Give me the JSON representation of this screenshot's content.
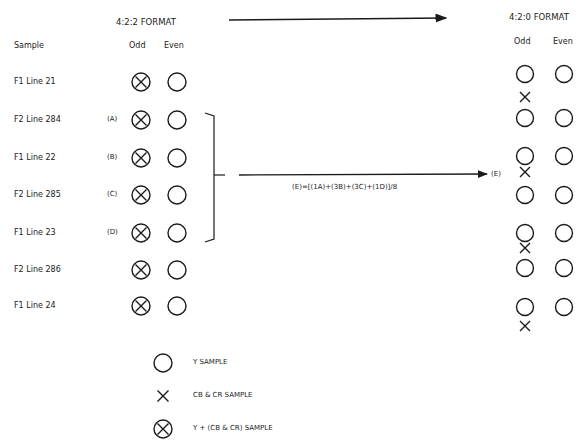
{
  "left_format": {
    "title": "4:2:2 FORMAT",
    "sample_header": "Sample",
    "odd_header": "Odd",
    "even_header": "Even",
    "rows": [
      {
        "label": "F1 Line 21",
        "tag": ""
      },
      {
        "label": "F2 Line 284",
        "tag": "(A)"
      },
      {
        "label": "F1 Line 22",
        "tag": "(B)"
      },
      {
        "label": "F2 Line 285",
        "tag": "(C)"
      },
      {
        "label": "F1 Line 23",
        "tag": "(D)"
      },
      {
        "label": "F2 Line 286",
        "tag": ""
      },
      {
        "label": "F1 Line 24",
        "tag": ""
      }
    ]
  },
  "right_format": {
    "title": "4:2:0 FORMAT",
    "odd_header": "Odd",
    "even_header": "Even",
    "row_count": 7,
    "chroma_after_rows": [
      0,
      2,
      4,
      6
    ]
  },
  "formula": {
    "text": "(E)=[(1A)+(3B)+(3C)+(1D)]/8",
    "target_label": "(E)"
  },
  "legend": [
    {
      "icon": "circle-icon",
      "label": "Y SAMPLE"
    },
    {
      "icon": "cross-icon",
      "label": "CB & CR SAMPLE"
    },
    {
      "icon": "circle-cross-icon",
      "label": "Y + (CB & CR) SAMPLE"
    }
  ],
  "colors": {
    "ink": "#1a1a1a",
    "background": "#ffffff"
  }
}
